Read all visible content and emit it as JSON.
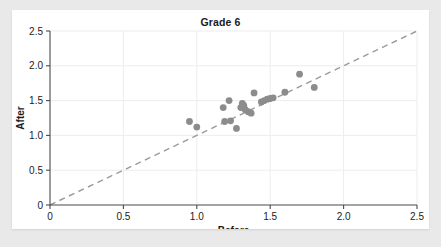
{
  "chart_data": {
    "type": "scatter",
    "title": "Grade 6",
    "xlabel": "Before",
    "ylabel": "After",
    "xlim": [
      0,
      2.5
    ],
    "ylim": [
      0,
      2.5
    ],
    "xticks": [
      "0",
      "0.5",
      "1.0",
      "1.5",
      "2.0",
      "2.5"
    ],
    "xtick_values": [
      0,
      0.5,
      1.0,
      1.5,
      2.0,
      2.5
    ],
    "yticks": [
      "0",
      "0.5",
      "1.0",
      "1.5",
      "2.0",
      "2.5"
    ],
    "ytick_values": [
      0,
      0.5,
      1.0,
      1.5,
      2.0,
      2.5
    ],
    "grid": true,
    "legend": "none",
    "point_color": "#8c8c8c",
    "reference_line": {
      "label": "y = x",
      "style": "dashed",
      "color": "#9a9a9a",
      "from": [
        0,
        0
      ],
      "to": [
        2.5,
        2.5
      ]
    },
    "points": [
      [
        0.95,
        1.2
      ],
      [
        1.0,
        1.12
      ],
      [
        1.18,
        1.4
      ],
      [
        1.19,
        1.2
      ],
      [
        1.22,
        1.5
      ],
      [
        1.23,
        1.21
      ],
      [
        1.27,
        1.1
      ],
      [
        1.3,
        1.4
      ],
      [
        1.31,
        1.46
      ],
      [
        1.32,
        1.43
      ],
      [
        1.33,
        1.37
      ],
      [
        1.35,
        1.34
      ],
      [
        1.37,
        1.32
      ],
      [
        1.39,
        1.61
      ],
      [
        1.44,
        1.48
      ],
      [
        1.46,
        1.5
      ],
      [
        1.48,
        1.52
      ],
      [
        1.5,
        1.53
      ],
      [
        1.52,
        1.54
      ],
      [
        1.6,
        1.62
      ],
      [
        1.7,
        1.88
      ],
      [
        1.8,
        1.69
      ]
    ]
  }
}
